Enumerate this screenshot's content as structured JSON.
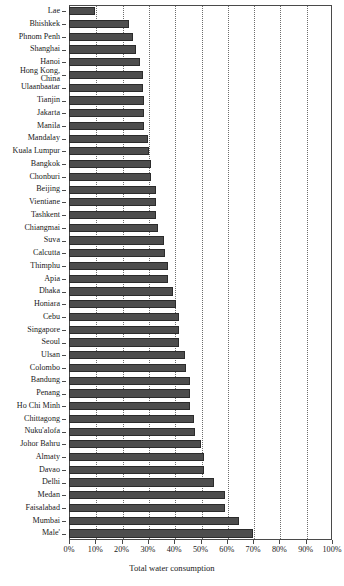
{
  "chart_data": {
    "type": "bar",
    "orientation": "horizontal",
    "title": "",
    "xlabel": "Total water consumption",
    "ylabel": "",
    "xlim": [
      0,
      100
    ],
    "xunit": "%",
    "grid": true,
    "legend": null,
    "xticklabels": [
      "0%",
      "10%",
      "20%",
      "30%",
      "40%",
      "50%",
      "60%",
      "70%",
      "80%",
      "90%",
      "100%"
    ],
    "xtickvalues": [
      0,
      10,
      20,
      30,
      40,
      50,
      60,
      70,
      80,
      90,
      100
    ],
    "bar_color": "#4d4d4d",
    "categories": [
      "Lae",
      "Bhishkek",
      "Phnom Penh",
      "Shanghai",
      "Hanoi",
      "Hong Kong, China",
      "Ulaanbaatar",
      "Tianjin",
      "Jakarta",
      "Manila",
      "Mandalay",
      "Kuala Lumpur",
      "Bangkok",
      "Chonburi",
      "Beijing",
      "Vientiane",
      "Tashkent",
      "Chiangmai",
      "Suva",
      "Calcutta",
      "Thimphu",
      "Apia",
      "Dhaka",
      "Honiara",
      "Cebu",
      "Singapore",
      "Seoul",
      "Ulsan",
      "Colombo",
      "Bandung",
      "Penang",
      "Ho Chi Minh",
      "Chittagong",
      "Nuku'alofa",
      "Johor Bahru",
      "Almaty",
      "Davao",
      "Delhi",
      "Medan",
      "Faisalabad",
      "Mumbai",
      "Male'"
    ],
    "values": [
      10.0,
      23.0,
      24.5,
      25.5,
      27.0,
      28.0,
      28.0,
      28.5,
      28.5,
      28.5,
      30.0,
      30.5,
      31.0,
      31.0,
      33.0,
      33.0,
      33.0,
      34.0,
      36.0,
      36.5,
      37.5,
      37.5,
      39.5,
      40.5,
      42.0,
      42.0,
      42.0,
      44.0,
      44.5,
      46.0,
      46.0,
      46.0,
      47.5,
      48.0,
      50.0,
      51.5,
      51.5,
      55.0,
      59.5,
      59.5,
      64.5,
      70.0
    ]
  }
}
